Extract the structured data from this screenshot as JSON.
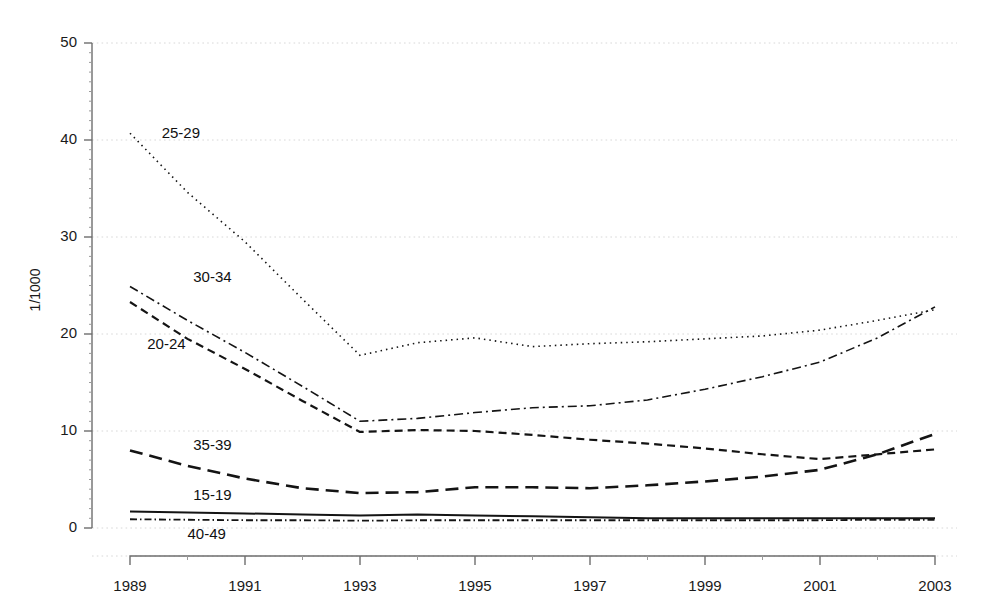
{
  "chart_data": {
    "type": "line",
    "title": "",
    "subtitle": "",
    "xlabel": "",
    "ylabel": "1/1000",
    "x": [
      1989,
      1990,
      1991,
      1992,
      1993,
      1994,
      1995,
      1996,
      1997,
      1998,
      1999,
      2000,
      2001,
      2002,
      2003
    ],
    "xlim": [
      1989,
      2003
    ],
    "ylim": [
      0,
      50
    ],
    "x_ticks": [
      1989,
      1991,
      1993,
      1995,
      1997,
      1999,
      2001,
      2003
    ],
    "x_tick_labels": [
      "1989",
      "1991",
      "1993",
      "1995",
      "1997",
      "1999",
      "2001",
      "2003"
    ],
    "x_minor_ticks": [
      1990,
      1992,
      1994,
      1996,
      1998,
      2000,
      2002
    ],
    "y_ticks": [
      0,
      10,
      20,
      30,
      40,
      50
    ],
    "y_tick_labels": [
      "0",
      "10",
      "20",
      "30",
      "40",
      "50"
    ],
    "grid": true,
    "grid_axis": "y",
    "legend": "inline-labels",
    "series": [
      {
        "name": "25-29",
        "label": "25-29",
        "linestyle": "dotted",
        "dasharray": "1.5 4",
        "width": 1.6,
        "color": "#141414",
        "label_x": 1989.55,
        "label_y": 40.2,
        "values": [
          40.7,
          34.6,
          29.5,
          23.6,
          17.8,
          19.1,
          19.6,
          18.7,
          19.0,
          19.2,
          19.5,
          19.8,
          20.4,
          21.4,
          22.5
        ]
      },
      {
        "name": "30-34",
        "label": "30-34",
        "linestyle": "dashdot",
        "dasharray": "9 4 2 4",
        "width": 1.6,
        "color": "#141414",
        "label_x": 1990.1,
        "label_y": 25.4,
        "values": [
          24.9,
          21.4,
          18.1,
          14.6,
          11.0,
          11.3,
          11.9,
          12.4,
          12.6,
          13.2,
          14.3,
          15.6,
          17.1,
          19.6,
          22.8
        ]
      },
      {
        "name": "20-24",
        "label": "20-24",
        "linestyle": "dashed",
        "dasharray": "8 5",
        "width": 2.2,
        "color": "#141414",
        "label_x": 1989.3,
        "label_y": 18.5,
        "values": [
          23.3,
          19.5,
          16.4,
          13.1,
          9.9,
          10.1,
          10.0,
          9.6,
          9.1,
          8.7,
          8.2,
          7.6,
          7.1,
          7.6,
          8.1
        ]
      },
      {
        "name": "35-39",
        "label": "35-39",
        "linestyle": "longdash",
        "dasharray": "13 7",
        "width": 2.6,
        "color": "#141414",
        "label_x": 1990.1,
        "label_y": 8.0,
        "values": [
          8.0,
          6.4,
          5.1,
          4.1,
          3.6,
          3.7,
          4.2,
          4.2,
          4.1,
          4.4,
          4.8,
          5.3,
          6.0,
          7.6,
          9.7
        ]
      },
      {
        "name": "15-19",
        "label": "15-19",
        "linestyle": "solid",
        "dasharray": "0",
        "width": 2.0,
        "color": "#141414",
        "label_x": 1990.1,
        "label_y": 2.9,
        "values": [
          1.7,
          1.6,
          1.5,
          1.4,
          1.3,
          1.4,
          1.3,
          1.2,
          1.1,
          1.0,
          1.0,
          1.0,
          1.0,
          1.0,
          1.0
        ]
      },
      {
        "name": "40-49",
        "label": "40-49",
        "linestyle": "dashdot",
        "dasharray": "7 3 1.5 3",
        "width": 1.8,
        "color": "#141414",
        "label_x": 1990.0,
        "label_y": -1.1,
        "values": [
          0.9,
          0.85,
          0.8,
          0.8,
          0.75,
          0.8,
          0.8,
          0.8,
          0.8,
          0.8,
          0.8,
          0.8,
          0.8,
          0.85,
          0.85
        ]
      }
    ]
  },
  "plot_geometry": {
    "left": 92,
    "right": 957,
    "top": 43,
    "bottom": 528,
    "x_axis_y": 556,
    "x_axis_left": 130,
    "x_axis_right": 935
  }
}
